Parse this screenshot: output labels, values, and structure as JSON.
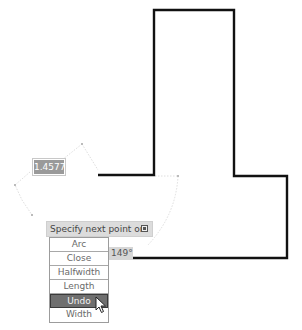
{
  "drawing": {
    "shape": "t-shaped polyline",
    "line_color": "#111111",
    "tracking_color": "#d8d8d8",
    "polyline_points": [
      [
        98,
        175
      ],
      [
        154,
        175
      ],
      [
        154,
        10
      ],
      [
        234,
        10
      ],
      [
        234,
        176
      ],
      [
        287,
        176
      ],
      [
        287,
        258
      ],
      [
        132,
        258
      ]
    ],
    "tracking_arc_points": [
      [
        82,
        144
      ],
      [
        15,
        185
      ],
      [
        32,
        215
      ],
      [
        178,
        176
      ]
    ]
  },
  "dynamic_input": {
    "length_value": "1.4577",
    "angle_value": "149°"
  },
  "command_prompt": {
    "text": "Specify next point or",
    "dropdown_icon": "down-arrow-icon"
  },
  "options_menu": {
    "items": [
      {
        "label": "Arc",
        "active": false
      },
      {
        "label": "Close",
        "active": false
      },
      {
        "label": "Halfwidth",
        "active": false
      },
      {
        "label": "Length",
        "active": false
      },
      {
        "label": "Undo",
        "active": true
      },
      {
        "label": "Width",
        "active": false
      }
    ],
    "highlight_color": "#6f6f6f"
  },
  "cursor": {
    "type": "arrow-pointer",
    "over_item": "Undo"
  }
}
